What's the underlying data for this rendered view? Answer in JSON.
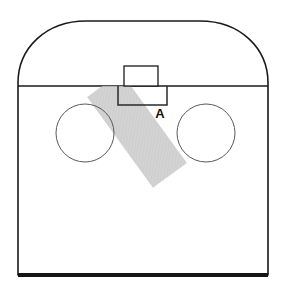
{
  "figure": {
    "background_color": "#ffffff",
    "width": 284,
    "height": 285,
    "annotations": [
      {
        "id": "label-a",
        "text": "A",
        "x": 160,
        "y": 118,
        "bold": true,
        "color": "#111111",
        "font_size": 13
      }
    ],
    "shapes": {
      "arch_outline": {
        "name": "arched-body-outline",
        "description": "Large rounded-top enclosure outline",
        "stroke_color": "#1a1a1a",
        "fill_color": "#ffffff",
        "stroke_width": 1.6,
        "left": 18,
        "right": 268,
        "shoulder_y": 86,
        "top_y": 21,
        "bottom_y": 275,
        "corner_radius": 62
      },
      "base_line": {
        "name": "base-edge",
        "description": "Thick dark bottom edge of the enclosure",
        "stroke_color": "#151515",
        "stroke_width": 4.2,
        "x1": 18,
        "x2": 268,
        "y": 275
      },
      "shoulder_line": {
        "name": "shoulder-divider-line",
        "description": "Horizontal line where the arch meets the straight body",
        "stroke_color": "#1a1a1a",
        "stroke_width": 1.4,
        "x1": 18,
        "x2": 268,
        "y": 86
      },
      "upper_tab": {
        "name": "upper-tab-rectangle",
        "description": "Small rectangle protruding above the shoulder line",
        "stroke_color": "#1a1a1a",
        "fill_color": "#ffffff",
        "stroke_width": 1.3,
        "x": 124,
        "y": 66,
        "width": 34,
        "height": 20
      },
      "lower_tab": {
        "name": "lower-tab-rectangle",
        "description": "Wider rectangle below the shoulder line",
        "stroke_color": "#2a2a2a",
        "fill_color": "none",
        "stroke_width": 1.5,
        "x": 118,
        "y": 86,
        "width": 49,
        "height": 19
      },
      "left_circle": {
        "name": "left-circle",
        "description": "Thin-stroke circle on the left half",
        "stroke_color": "#555555",
        "fill_color": "none",
        "stroke_width": 1.0,
        "cx": 85,
        "cy": 133,
        "r": 29
      },
      "right_circle": {
        "name": "right-circle",
        "description": "Thin-stroke circle on the right half",
        "stroke_color": "#555555",
        "fill_color": "none",
        "stroke_width": 1.0,
        "cx": 206,
        "cy": 133,
        "r": 29
      },
      "diagonal_band": {
        "name": "diagonal-shaded-band",
        "description": "Semi-transparent hatched gray band angled down to the right",
        "fill_color": "#c6c6c6",
        "opacity": 0.75,
        "rotation_deg": 36,
        "x": 116,
        "y": 84,
        "width": 42,
        "height": 92
      }
    }
  }
}
